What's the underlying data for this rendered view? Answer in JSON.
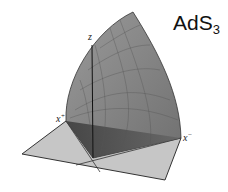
{
  "title": {
    "main": "AdS",
    "subscript": "3"
  },
  "axes": {
    "z": "z",
    "x_plus": {
      "base": "x",
      "sup": "+"
    },
    "x_minus": {
      "base": "x",
      "sup": "−"
    }
  },
  "colors": {
    "surface": "#8a8a8a",
    "surface_dark": "#4a4a4a",
    "plane": "#c4c4c4",
    "edge": "#333333"
  }
}
